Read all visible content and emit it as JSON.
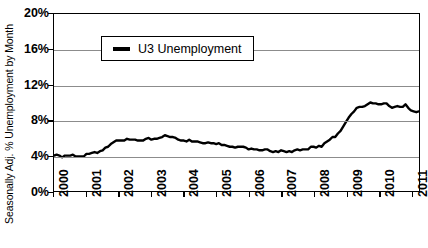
{
  "chart_data": {
    "type": "line",
    "title": "",
    "xlabel": "",
    "ylabel": "Seasonally Adj. % Unemployment by Month",
    "ylim": [
      0,
      20
    ],
    "xlim": [
      2000,
      2011.25
    ],
    "yticks": [
      0,
      4,
      8,
      12,
      16,
      20
    ],
    "ytick_labels": [
      "0%",
      "4%",
      "8%",
      "12%",
      "16%",
      "20%"
    ],
    "xticks": [
      2000,
      2001,
      2002,
      2003,
      2004,
      2005,
      2006,
      2007,
      2008,
      2009,
      2010,
      2011
    ],
    "xtick_labels": [
      "2000",
      "2001",
      "2002",
      "2003",
      "2004",
      "2005",
      "2006",
      "2007",
      "2008",
      "2009",
      "2010",
      "2011"
    ],
    "grid": "horizontal",
    "legend_position": "top-left-inside",
    "series": [
      {
        "name": "U3 Unemployment",
        "color": "#000000",
        "x": [
          2000.0,
          2000.083,
          2000.167,
          2000.25,
          2000.333,
          2000.417,
          2000.5,
          2000.583,
          2000.667,
          2000.75,
          2000.833,
          2000.917,
          2001.0,
          2001.083,
          2001.167,
          2001.25,
          2001.333,
          2001.417,
          2001.5,
          2001.583,
          2001.667,
          2001.75,
          2001.833,
          2001.917,
          2002.0,
          2002.083,
          2002.167,
          2002.25,
          2002.333,
          2002.417,
          2002.5,
          2002.583,
          2002.667,
          2002.75,
          2002.833,
          2002.917,
          2003.0,
          2003.083,
          2003.167,
          2003.25,
          2003.333,
          2003.417,
          2003.5,
          2003.583,
          2003.667,
          2003.75,
          2003.833,
          2003.917,
          2004.0,
          2004.083,
          2004.167,
          2004.25,
          2004.333,
          2004.417,
          2004.5,
          2004.583,
          2004.667,
          2004.75,
          2004.833,
          2004.917,
          2005.0,
          2005.083,
          2005.167,
          2005.25,
          2005.333,
          2005.417,
          2005.5,
          2005.583,
          2005.667,
          2005.75,
          2005.833,
          2005.917,
          2006.0,
          2006.083,
          2006.167,
          2006.25,
          2006.333,
          2006.417,
          2006.5,
          2006.583,
          2006.667,
          2006.75,
          2006.833,
          2006.917,
          2007.0,
          2007.083,
          2007.167,
          2007.25,
          2007.333,
          2007.417,
          2007.5,
          2007.583,
          2007.667,
          2007.75,
          2007.833,
          2007.917,
          2008.0,
          2008.083,
          2008.167,
          2008.25,
          2008.333,
          2008.417,
          2008.5,
          2008.583,
          2008.667,
          2008.75,
          2008.833,
          2008.917,
          2009.0,
          2009.083,
          2009.167,
          2009.25,
          2009.333,
          2009.417,
          2009.5,
          2009.583,
          2009.667,
          2009.75,
          2009.833,
          2009.917,
          2010.0,
          2010.083,
          2010.167,
          2010.25,
          2010.333,
          2010.417,
          2010.5,
          2010.583,
          2010.667,
          2010.75,
          2010.833,
          2010.917,
          2011.0,
          2011.083,
          2011.167,
          2011.25
        ],
        "values": [
          4.0,
          4.1,
          4.0,
          3.8,
          4.0,
          4.0,
          4.0,
          4.1,
          3.9,
          3.9,
          3.9,
          3.9,
          4.2,
          4.2,
          4.3,
          4.4,
          4.3,
          4.5,
          4.6,
          4.9,
          5.0,
          5.3,
          5.5,
          5.7,
          5.7,
          5.7,
          5.7,
          5.9,
          5.8,
          5.8,
          5.8,
          5.7,
          5.7,
          5.7,
          5.9,
          6.0,
          5.8,
          5.9,
          5.9,
          6.0,
          6.1,
          6.3,
          6.2,
          6.1,
          6.1,
          6.0,
          5.8,
          5.7,
          5.7,
          5.6,
          5.8,
          5.6,
          5.6,
          5.6,
          5.5,
          5.4,
          5.4,
          5.5,
          5.4,
          5.4,
          5.3,
          5.4,
          5.2,
          5.2,
          5.1,
          5.0,
          5.0,
          4.9,
          5.0,
          5.0,
          5.0,
          4.9,
          4.7,
          4.8,
          4.7,
          4.7,
          4.6,
          4.6,
          4.7,
          4.7,
          4.5,
          4.4,
          4.5,
          4.4,
          4.6,
          4.5,
          4.4,
          4.5,
          4.4,
          4.6,
          4.7,
          4.6,
          4.7,
          4.7,
          4.7,
          5.0,
          5.0,
          4.9,
          5.1,
          5.0,
          5.4,
          5.6,
          5.8,
          6.1,
          6.1,
          6.5,
          6.8,
          7.3,
          7.8,
          8.3,
          8.7,
          9.0,
          9.4,
          9.5,
          9.5,
          9.6,
          9.8,
          10.0,
          9.9,
          9.9,
          9.8,
          9.8,
          9.9,
          9.9,
          9.6,
          9.4,
          9.5,
          9.6,
          9.5,
          9.5,
          9.8,
          9.4,
          9.1,
          9.0,
          8.9,
          9.0
        ]
      }
    ]
  },
  "legend": {
    "entries": [
      {
        "label": "U3 Unemployment",
        "color": "#000000"
      }
    ]
  },
  "axes": {
    "y_title": "Seasonally Adj. % Unemployment by Month"
  }
}
